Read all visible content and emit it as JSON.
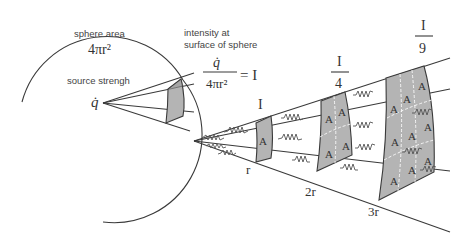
{
  "diagram": {
    "left_panel": {
      "sphere_area_label": "sphere area",
      "sphere_area_formula": "4πr²",
      "source_label": "source strengh",
      "source_symbol": "q̇",
      "intensity_label_line1": "intensity at",
      "intensity_label_line2": "surface of sphere",
      "intensity_numerator": "q̇",
      "intensity_denominator": "4πr²",
      "intensity_equals": "= I"
    },
    "right_panel": {
      "area_symbol": "A",
      "stages": [
        {
          "distance": "r",
          "intensity_num": "I",
          "intensity_den": "",
          "area_count": 1
        },
        {
          "distance": "2r",
          "intensity_num": "I",
          "intensity_den": "4",
          "area_count": 4
        },
        {
          "distance": "3r",
          "intensity_num": "I",
          "intensity_den": "9",
          "area_count": 9
        }
      ]
    },
    "colors": {
      "line": "#3a3a3a",
      "patch_fill": "#b4b4b4",
      "text": "#444444",
      "background": "#ffffff"
    }
  }
}
